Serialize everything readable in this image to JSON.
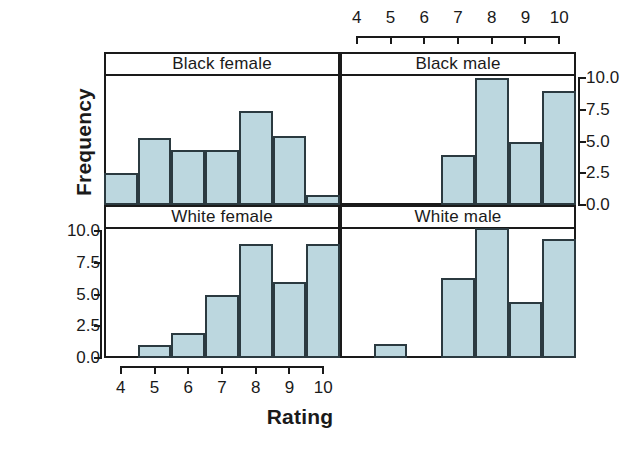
{
  "chart_data": {
    "type": "bar",
    "title": "",
    "xlabel": "Rating",
    "ylabel": "Frequency",
    "xlim": [
      3.5,
      10.5
    ],
    "ylim": [
      0.0,
      10.0
    ],
    "grid": false,
    "legend": "none",
    "layout": "2x2 trellis panels",
    "x_ticks": [
      "4",
      "5",
      "6",
      "7",
      "8",
      "9",
      "10"
    ],
    "x_tick_values": [
      4,
      5,
      6,
      7,
      8,
      9,
      10
    ],
    "y_ticks": [
      "0.0",
      "2.5",
      "5.0",
      "7.5",
      "10.0"
    ],
    "y_tick_values": [
      0.0,
      2.5,
      5.0,
      7.5,
      10.0
    ],
    "bin_width": 1,
    "panels": [
      {
        "id": "black-female",
        "label": "Black female",
        "row": 0,
        "col": 0,
        "categories": [
          4,
          5,
          6,
          7,
          8,
          9,
          10
        ],
        "values": [
          2.5,
          5.3,
          4.3,
          4.3,
          7.4,
          5.4,
          0.8
        ]
      },
      {
        "id": "black-male",
        "label": "Black male",
        "row": 0,
        "col": 1,
        "categories": [
          4,
          5,
          6,
          7,
          8,
          9,
          10
        ],
        "values": [
          0,
          0,
          0,
          3.9,
          10.0,
          5.0,
          9.0
        ]
      },
      {
        "id": "white-female",
        "label": "White female",
        "row": 1,
        "col": 0,
        "categories": [
          4,
          5,
          6,
          7,
          8,
          9,
          10
        ],
        "values": [
          0,
          1.0,
          2.0,
          5.0,
          9.0,
          6.0,
          9.0
        ]
      },
      {
        "id": "white-male",
        "label": "White male",
        "row": 1,
        "col": 1,
        "categories": [
          4,
          5,
          6,
          7,
          8,
          9,
          10
        ],
        "values": [
          0,
          1.1,
          0,
          6.3,
          10.2,
          4.4,
          9.4
        ]
      }
    ]
  },
  "style": {
    "bar_fill": "#bcd7df",
    "bar_stroke": "#2b3a40",
    "axis_color": "#1a1a1a",
    "panel_bg": "#ffffff"
  }
}
